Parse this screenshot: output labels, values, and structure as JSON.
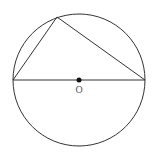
{
  "diagram": {
    "type": "geometry",
    "stroke_color": "#333333",
    "circle": {
      "cx": 79,
      "cy": 80,
      "r": 66
    },
    "center": {
      "label": "O",
      "x": 79,
      "y": 80
    },
    "vertices": {
      "left": {
        "x": 13,
        "y": 80
      },
      "right": {
        "x": 145,
        "y": 80
      },
      "top": {
        "x": 57,
        "y": 17
      }
    },
    "segments": [
      {
        "from": "left",
        "to": "right",
        "role": "diameter"
      },
      {
        "from": "left",
        "to": "top",
        "role": "chord"
      },
      {
        "from": "top",
        "to": "right",
        "role": "chord"
      }
    ]
  }
}
